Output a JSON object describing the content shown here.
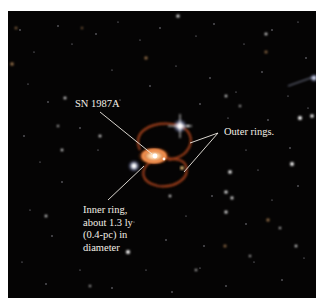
{
  "figure": {
    "subject": "SN 1987A",
    "annotations": {
      "sn_label": "SN 1987A",
      "outer_rings_label": "Outer rings.",
      "inner_ring_lines": [
        "Inner ring,",
        "about 1.3 ly",
        "(0.4-pc) in",
        "diameter"
      ]
    },
    "colors": {
      "background": "#ffffff",
      "sky": "#050404",
      "ring": "#c8552a",
      "inner_ring": "#e07a3c",
      "label_text": "#f4efe6",
      "leader_line": "#f0ece4"
    }
  }
}
